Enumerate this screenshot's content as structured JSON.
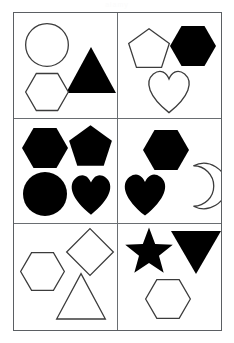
{
  "watermark": {
    "text": "alamy"
  },
  "figure": {
    "columns": 2,
    "rows": 3,
    "border_color": "#5b5f63",
    "divider_color": "#6a6e72",
    "fill_black": "#000000",
    "fill_white": "#ffffff",
    "stroke_color": "#3c3c3c",
    "background": "#ffffff"
  },
  "panels": [
    {
      "id": "panel-1",
      "position": "top-left",
      "shape_count": 3,
      "shapes": [
        {
          "name": "circle",
          "fill": "white",
          "x": 11,
          "y": 10,
          "size": 44,
          "label": "Circle outline"
        },
        {
          "name": "triangle",
          "fill": "black",
          "x": 52,
          "y": 34,
          "size": 50,
          "label": "Black triangle"
        },
        {
          "name": "hexagon",
          "fill": "white",
          "x": 11,
          "y": 57,
          "size": 44,
          "label": "Hexagon outline"
        }
      ]
    },
    {
      "id": "panel-2",
      "position": "top-right",
      "shape_count": 3,
      "shapes": [
        {
          "name": "pentagon",
          "fill": "white",
          "x": 9,
          "y": 14,
          "size": 44,
          "label": "Pentagon outline"
        },
        {
          "name": "hexagon",
          "fill": "black",
          "x": 52,
          "y": 10,
          "size": 46,
          "label": "Black hexagon"
        },
        {
          "name": "heart",
          "fill": "white",
          "x": 28,
          "y": 55,
          "size": 46,
          "label": "Heart outline"
        }
      ]
    },
    {
      "id": "panel-3",
      "position": "middle-left",
      "shape_count": 4,
      "shapes": [
        {
          "name": "hexagon",
          "fill": "black",
          "x": 8,
          "y": 6,
          "size": 46,
          "label": "Black hexagon"
        },
        {
          "name": "pentagon",
          "fill": "black",
          "x": 54,
          "y": 5,
          "size": 45,
          "label": "Black pentagon"
        },
        {
          "name": "circle",
          "fill": "black",
          "x": 9,
          "y": 53,
          "size": 44,
          "label": "Black circle"
        },
        {
          "name": "heart",
          "fill": "black",
          "x": 55,
          "y": 53,
          "size": 44,
          "label": "Black heart"
        }
      ]
    },
    {
      "id": "panel-4",
      "position": "middle-right",
      "shape_count": 3,
      "shapes": [
        {
          "name": "hexagon",
          "fill": "black",
          "x": 25,
          "y": 8,
          "size": 46,
          "label": "Black hexagon"
        },
        {
          "name": "heart",
          "fill": "black",
          "x": 4,
          "y": 52,
          "size": 46,
          "label": "Black heart"
        },
        {
          "name": "crescent",
          "fill": "white",
          "x": 55,
          "y": 45,
          "size": 44,
          "label": "Crescent moon outline"
        }
      ]
    },
    {
      "id": "panel-5",
      "position": "bottom-left",
      "shape_count": 3,
      "shapes": [
        {
          "name": "hexagon",
          "fill": "white",
          "x": 6,
          "y": 25,
          "size": 45,
          "label": "Hexagon outline"
        },
        {
          "name": "diamond",
          "fill": "white",
          "x": 52,
          "y": 4,
          "size": 48,
          "label": "Diamond outline"
        },
        {
          "name": "triangle",
          "fill": "white",
          "x": 42,
          "y": 49,
          "size": 50,
          "label": "Triangle outline"
        }
      ]
    },
    {
      "id": "panel-6",
      "position": "bottom-right",
      "shape_count": 3,
      "shapes": [
        {
          "name": "star",
          "fill": "black",
          "x": 6,
          "y": 3,
          "size": 50,
          "label": "Black star"
        },
        {
          "name": "triangle-down",
          "fill": "black",
          "x": 53,
          "y": 4,
          "size": 50,
          "label": "Black inverted triangle"
        },
        {
          "name": "hexagon",
          "fill": "white",
          "x": 27,
          "y": 52,
          "size": 46,
          "label": "Hexagon outline"
        }
      ]
    }
  ]
}
